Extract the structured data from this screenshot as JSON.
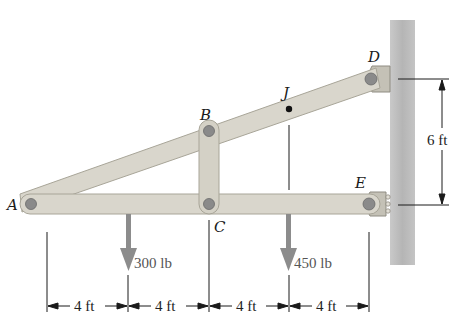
{
  "figure": {
    "points": {
      "A": "A",
      "B": "B",
      "C": "C",
      "D": "D",
      "E": "E",
      "J": "J"
    },
    "loads": [
      {
        "label": "300 lb",
        "at": "between A and C"
      },
      {
        "label": "450 lb",
        "at": "below J"
      }
    ],
    "horizontal_dimensions": [
      "4 ft",
      "4 ft",
      "4 ft",
      "4 ft"
    ],
    "vertical_dimension": "6 ft",
    "colors": {
      "member_fill": "#d9d6cc",
      "member_stroke": "#a8a598",
      "pin": "#8a8a8a",
      "wall": "#bdbdbd",
      "load_arrow": "#8c8c8c",
      "line": "#1a1a1a"
    }
  }
}
